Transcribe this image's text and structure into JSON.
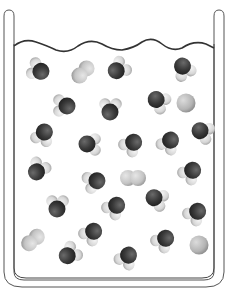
{
  "diagram": {
    "colors": {
      "oxygen": "#3a3a3a",
      "hydrogen": "#d9d9d9",
      "diatomic": "#c8c8c8",
      "single_atom": "#b8b8b8",
      "outline": "#333333",
      "background": "#ffffff"
    },
    "molecules": [
      {
        "type": "water",
        "x": 40,
        "y": 71,
        "angle": 200
      },
      {
        "type": "diatomic",
        "x": 83,
        "y": 72,
        "angle": 135
      },
      {
        "type": "water",
        "x": 117,
        "y": 70,
        "angle": 320
      },
      {
        "type": "water",
        "x": 183,
        "y": 67,
        "angle": 60
      },
      {
        "type": "water",
        "x": 66,
        "y": 106,
        "angle": 180
      },
      {
        "type": "water",
        "x": 110,
        "y": 111,
        "angle": 270
      },
      {
        "type": "water",
        "x": 157,
        "y": 100,
        "angle": 30
      },
      {
        "type": "single",
        "x": 186,
        "y": 103
      },
      {
        "type": "water",
        "x": 44,
        "y": 133,
        "angle": 110
      },
      {
        "type": "water",
        "x": 88,
        "y": 144,
        "angle": 0
      },
      {
        "type": "water",
        "x": 133,
        "y": 143,
        "angle": 130
      },
      {
        "type": "water",
        "x": 170,
        "y": 141,
        "angle": 120
      },
      {
        "type": "water",
        "x": 201,
        "y": 131,
        "angle": 20
      },
      {
        "type": "water",
        "x": 37,
        "y": 171,
        "angle": 300
      },
      {
        "type": "water",
        "x": 96,
        "y": 181,
        "angle": 160
      },
      {
        "type": "diatomic",
        "x": 133,
        "y": 178,
        "angle": 0
      },
      {
        "type": "water",
        "x": 192,
        "y": 171,
        "angle": 130
      },
      {
        "type": "water",
        "x": 57,
        "y": 208,
        "angle": 270
      },
      {
        "type": "water",
        "x": 116,
        "y": 206,
        "angle": 130
      },
      {
        "type": "water",
        "x": 155,
        "y": 198,
        "angle": 20
      },
      {
        "type": "water",
        "x": 197,
        "y": 212,
        "angle": 130
      },
      {
        "type": "water",
        "x": 93,
        "y": 232,
        "angle": 130
      },
      {
        "type": "water",
        "x": 165,
        "y": 239,
        "angle": 130
      },
      {
        "type": "diatomic",
        "x": 33,
        "y": 240,
        "angle": 140
      },
      {
        "type": "water",
        "x": 68,
        "y": 255,
        "angle": 320
      },
      {
        "type": "water",
        "x": 128,
        "y": 256,
        "angle": 120
      },
      {
        "type": "single",
        "x": 199,
        "y": 245
      }
    ]
  }
}
